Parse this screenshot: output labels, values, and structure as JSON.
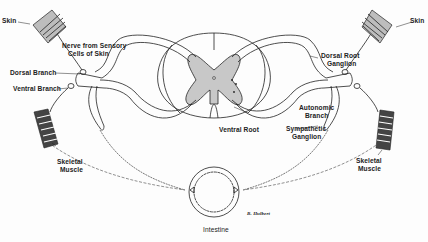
{
  "diagram": {
    "type": "anatomical-illustration",
    "colors": {
      "line": "#222222",
      "gray_matter": "#c8c8c8",
      "background": "#fdfdfd",
      "skin_fill": "#bdbdbd"
    },
    "labels": {
      "skin_left": "Skin",
      "skin_right": "Skin",
      "nerve_sensory_1": "Nerve from Sensory",
      "nerve_sensory_2": "Cells of Skin",
      "dorsal_branch": "Dorsal Branch",
      "ventral_branch": "Ventral Branch",
      "dorsal_root_ganglion_1": "Dorsal Root",
      "dorsal_root_ganglion_2": "Ganglion",
      "autonomic_branch_1": "Autonomic",
      "autonomic_branch_2": "Branch",
      "ventral_root": "Ventral Root",
      "sympathetic_ganglion_1": "Sympathetic",
      "sympathetic_ganglion_2": "Ganglion",
      "skeletal_muscle_left_1": "Skeletal",
      "skeletal_muscle_left_2": "Muscle",
      "skeletal_muscle_right_1": "Skeletal",
      "skeletal_muscle_right_2": "Muscle",
      "intestine": "Intestine",
      "signature": "B. Hulbert"
    }
  }
}
